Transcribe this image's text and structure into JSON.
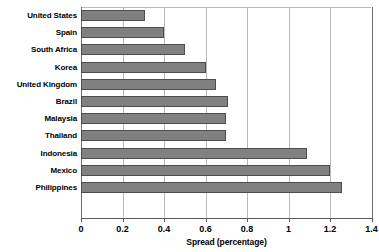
{
  "chart_data": {
    "type": "bar",
    "orientation": "horizontal",
    "title": "",
    "xlabel": "Spread (percentage)",
    "ylabel": "",
    "xlim": [
      0,
      1.4
    ],
    "xticks": [
      "0",
      "0.2",
      "0.4",
      "0.6",
      "0.8",
      "1",
      "1.2",
      "1.4"
    ],
    "xtick_values": [
      0,
      0.2,
      0.4,
      0.6,
      0.8,
      1.0,
      1.2,
      1.4
    ],
    "grid": "vertical",
    "legend": "none",
    "categories": [
      "United States",
      "Spain",
      "South Africa",
      "Korea",
      "United Kingdom",
      "Brazil",
      "Malaysia",
      "Thailand",
      "Indonesia",
      "Mexico",
      "Philippines"
    ],
    "values": [
      0.31,
      0.4,
      0.5,
      0.6,
      0.65,
      0.71,
      0.7,
      0.7,
      1.09,
      1.2,
      1.26
    ],
    "series": [
      {
        "name": "Spread (percentage)",
        "values": [
          0.31,
          0.4,
          0.5,
          0.6,
          0.65,
          0.71,
          0.7,
          0.7,
          1.09,
          1.2,
          1.26
        ]
      }
    ],
    "bar_color": "#808080",
    "bar_border_color": "#4d4d4d",
    "grid_color": "#b8b8b8",
    "axis_color": "#5a5a5a"
  }
}
